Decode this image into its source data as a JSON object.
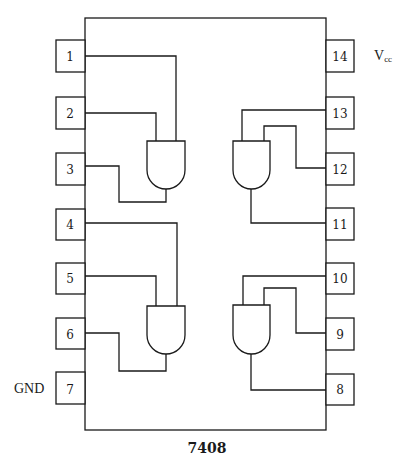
{
  "chip": {
    "part_number": "7408",
    "left_pins": [
      {
        "number": "1",
        "label": ""
      },
      {
        "number": "2",
        "label": ""
      },
      {
        "number": "3",
        "label": ""
      },
      {
        "number": "4",
        "label": ""
      },
      {
        "number": "5",
        "label": ""
      },
      {
        "number": "6",
        "label": ""
      },
      {
        "number": "7",
        "label": "GND"
      }
    ],
    "right_pins": [
      {
        "number": "14",
        "label": "V",
        "label_sub": "cc"
      },
      {
        "number": "13",
        "label": ""
      },
      {
        "number": "12",
        "label": ""
      },
      {
        "number": "11",
        "label": ""
      },
      {
        "number": "10",
        "label": ""
      },
      {
        "number": "9",
        "label": ""
      },
      {
        "number": "8",
        "label": ""
      }
    ],
    "gates": [
      {
        "type": "AND",
        "inputs": [
          "1",
          "2"
        ],
        "output": "3"
      },
      {
        "type": "AND",
        "inputs": [
          "13",
          "12"
        ],
        "output": "11"
      },
      {
        "type": "AND",
        "inputs": [
          "4",
          "5"
        ],
        "output": "6"
      },
      {
        "type": "AND",
        "inputs": [
          "10",
          "9"
        ],
        "output": "8"
      }
    ]
  }
}
